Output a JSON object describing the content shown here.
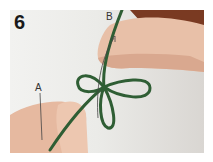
{
  "figure": {
    "step_number": "6",
    "labels": {
      "a": "A",
      "b": "B"
    },
    "colors": {
      "cord": "#2f5e34",
      "skin": "#e8c0a8",
      "skin_shadow": "#c98f78",
      "sleeve": "#7a3a22",
      "background": "#eeeeeb"
    }
  }
}
